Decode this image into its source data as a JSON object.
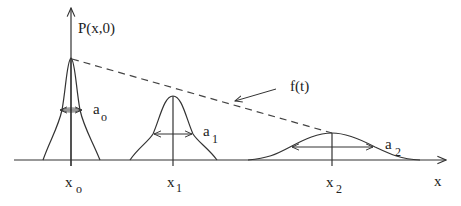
{
  "diagram": {
    "y_axis_label": "P(x,0)",
    "x_axis_label": "x",
    "envelope_label": "f(t)",
    "packets": [
      {
        "position_label": "x",
        "position_sub": "o",
        "width_label": "a",
        "width_sub": "o"
      },
      {
        "position_label": "x",
        "position_sub": "1",
        "width_label": "a",
        "width_sub": "1"
      },
      {
        "position_label": "x",
        "position_sub": "2",
        "width_label": "a",
        "width_sub": "2"
      }
    ]
  },
  "colors": {
    "stroke": "#333333",
    "background": "#ffffff"
  }
}
